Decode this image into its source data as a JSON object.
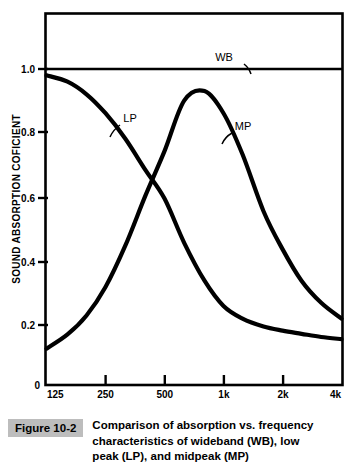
{
  "figure": {
    "tag": "Figure 10-2",
    "caption": "Comparison of absorption vs. frequency characteristics of wideband (WB), low peak (LP), and midpeak (MP)"
  },
  "axes": {
    "x_title": "FREQUENCY—Hz",
    "y_title": "SOUND ABSORPTION COFICIENT",
    "x_ticks": [
      "125",
      "250",
      "500",
      "1k",
      "2k",
      "4k"
    ],
    "y_ticks": [
      "0",
      "0.2",
      "0.4",
      "0.6",
      "0.8",
      "1.0"
    ]
  },
  "labels": {
    "wb": "WB",
    "lp": "LP",
    "mp": "MP"
  },
  "colors": {
    "curve": "#000000",
    "frame": "#000000",
    "background": "#ffffff",
    "tag_background": "#bdbdbd"
  },
  "chart_data": {
    "type": "line",
    "title": "Comparison of absorption vs. frequency characteristics of wideband (WB), low peak (LP), and midpeak (MP)",
    "xlabel": "FREQUENCY—Hz",
    "ylabel": "SOUND ABSORPTION COFICIENT",
    "xscale": "log",
    "xlim": [
      125,
      4000
    ],
    "ylim": [
      0,
      1.18
    ],
    "y_axis_max_labeled": 1.0,
    "grid": false,
    "legend": "inline-annotations",
    "x": [
      125,
      160,
      200,
      250,
      315,
      400,
      500,
      630,
      800,
      1000,
      1250,
      1600,
      2000,
      2500,
      3150,
      4000
    ],
    "series": [
      {
        "name": "WB",
        "label": "WB",
        "description": "wideband absorber — flat response",
        "values": [
          1.0,
          1.0,
          1.0,
          1.0,
          1.0,
          1.0,
          1.0,
          1.0,
          1.0,
          1.0,
          1.0,
          1.0,
          1.0,
          1.0,
          1.0,
          1.0
        ]
      },
      {
        "name": "LP",
        "label": "LP",
        "description": "low peak absorber — high absorption at low frequency, decaying",
        "values": [
          0.98,
          0.96,
          0.92,
          0.86,
          0.78,
          0.68,
          0.59,
          0.45,
          0.33,
          0.25,
          0.21,
          0.185,
          0.172,
          0.162,
          0.152,
          0.145
        ]
      },
      {
        "name": "MP",
        "label": "MP",
        "description": "midpeak absorber — peaks near 630 Hz",
        "values": [
          0.115,
          0.16,
          0.22,
          0.31,
          0.44,
          0.6,
          0.74,
          0.9,
          0.93,
          0.86,
          0.73,
          0.55,
          0.43,
          0.33,
          0.26,
          0.21
        ]
      }
    ],
    "annotations": [
      {
        "text": "WB",
        "series": "WB",
        "x": 1450,
        "y": 1.09
      },
      {
        "text": "LP",
        "series": "LP",
        "x": 330,
        "y": 0.845
      },
      {
        "text": "MP",
        "series": "MP",
        "x": 1130,
        "y": 0.805
      }
    ],
    "notes": {
      "crossover_point": {
        "frequency_hz": 470,
        "value": 0.62
      },
      "mp_peak": {
        "frequency_hz": 630,
        "value": 0.93
      },
      "lp_start": {
        "frequency_hz": 125,
        "value": 0.98
      },
      "mp_start": {
        "frequency_hz": 125,
        "value": 0.115
      },
      "lp_end": {
        "frequency_hz": 4000,
        "value": 0.145
      },
      "mp_end": {
        "frequency_hz": 4000,
        "value": 0.21
      }
    }
  }
}
